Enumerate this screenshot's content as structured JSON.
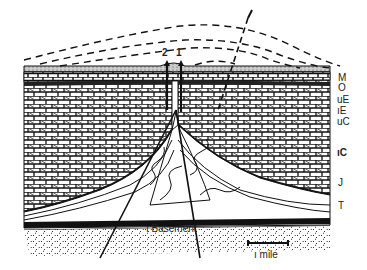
{
  "diagram": {
    "type": "geologic-cross-section",
    "strata_labels": [
      {
        "id": "M",
        "label": "M"
      },
      {
        "id": "O",
        "label": "O"
      },
      {
        "id": "uE",
        "label": "uE"
      },
      {
        "id": "lE",
        "label": "ıE"
      },
      {
        "id": "uC",
        "label": "uC"
      },
      {
        "id": "lC",
        "label": "ıC"
      },
      {
        "id": "J",
        "label": "J"
      },
      {
        "id": "T",
        "label": "T"
      }
    ],
    "fault_labels": [
      {
        "id": "f2",
        "label": "2"
      },
      {
        "id": "f1",
        "label": "1"
      }
    ],
    "basement_label": "ı Basement",
    "scale_bar": {
      "label": "ı mile"
    }
  }
}
